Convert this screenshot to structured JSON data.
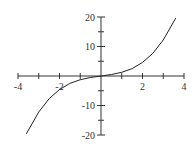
{
  "chart_data": {
    "type": "line",
    "title": "",
    "xlabel": "",
    "ylabel": "",
    "xlim": [
      -4,
      4
    ],
    "ylim": [
      -20,
      20
    ],
    "x_ticks": [
      -4,
      -3,
      -2,
      -1,
      0,
      1,
      2,
      3,
      4
    ],
    "x_tick_labels": [
      "-4",
      "-2",
      "2",
      "4"
    ],
    "x_labeled_values": [
      -4,
      -2,
      2,
      4
    ],
    "y_ticks": [
      -20,
      -15,
      -10,
      -5,
      0,
      5,
      10,
      15,
      20
    ],
    "y_tick_labels": [
      "20",
      "10",
      "-10",
      "-20"
    ],
    "y_labeled_values": [
      20,
      10,
      -10,
      -20
    ],
    "grid": false,
    "legend": null,
    "series": [
      {
        "name": "f(x)",
        "description": "odd cubic-like curve through origin",
        "x": [
          -3.6,
          -3,
          -2.5,
          -2,
          -1.5,
          -1,
          -0.5,
          0,
          0.5,
          1,
          1.5,
          2,
          2.5,
          3,
          3.6
        ],
        "y": [
          -19.6,
          -12.2,
          -7.7,
          -4.6,
          -2.5,
          -1.25,
          -0.5,
          0,
          0.5,
          1.25,
          2.5,
          4.6,
          7.7,
          12.2,
          19.6
        ]
      }
    ]
  }
}
